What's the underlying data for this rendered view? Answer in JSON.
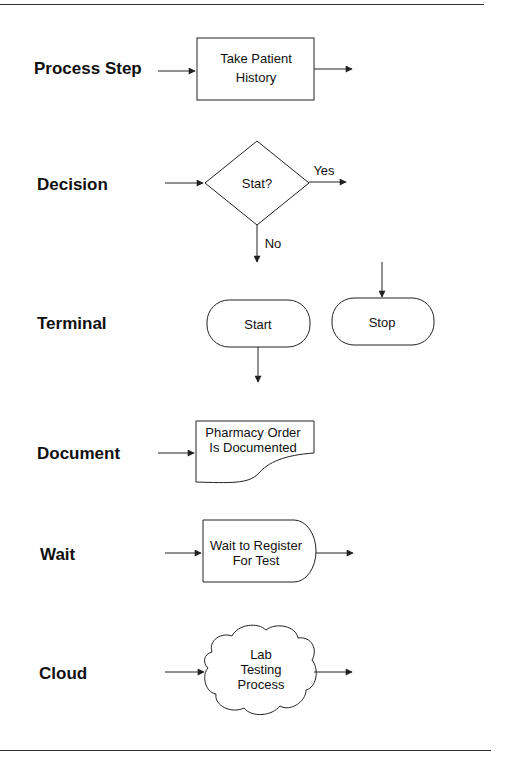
{
  "diagram": {
    "type": "flowchart-symbol-legend",
    "rows": [
      {
        "id": "process",
        "label": "Process Step",
        "symbol": "rectangle",
        "text": [
          "Take Patient",
          "History"
        ]
      },
      {
        "id": "decision",
        "label": "Decision",
        "symbol": "diamond",
        "text": [
          "Stat?"
        ],
        "branches": {
          "right": "Yes",
          "down": "No"
        }
      },
      {
        "id": "terminal",
        "label": "Terminal",
        "symbol": "rounded-rectangle",
        "shapes": [
          {
            "text": [
              "Start"
            ]
          },
          {
            "text": [
              "Stop"
            ]
          }
        ]
      },
      {
        "id": "document",
        "label": "Document",
        "symbol": "document",
        "text": [
          "Pharmacy Order",
          "Is Documented"
        ]
      },
      {
        "id": "wait",
        "label": "Wait",
        "symbol": "delay",
        "text": [
          "Wait to Register",
          "For Test"
        ]
      },
      {
        "id": "cloud",
        "label": "Cloud",
        "symbol": "cloud",
        "text": [
          "Lab",
          "Testing",
          "Process"
        ]
      }
    ],
    "colors": {
      "stroke": "#222222",
      "text": "#111111",
      "background": "#ffffff"
    }
  }
}
